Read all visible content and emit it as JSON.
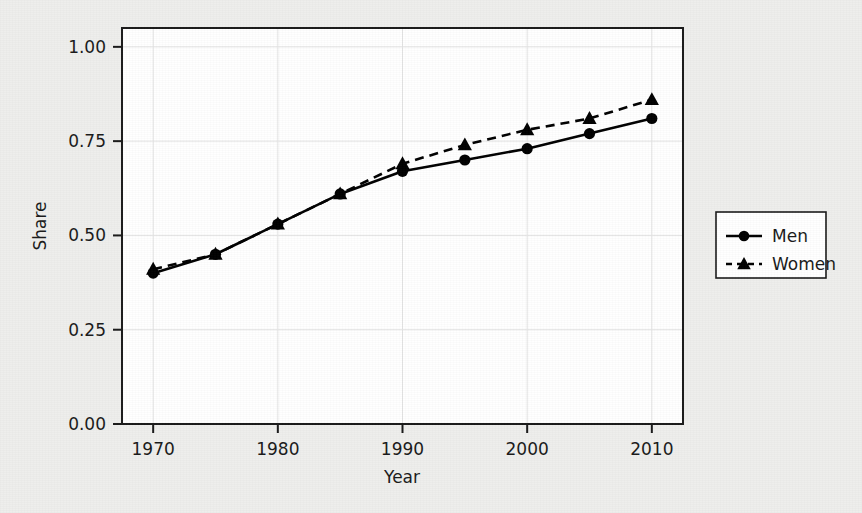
{
  "chart_data": {
    "type": "line",
    "title": "",
    "subtitle": "",
    "xlabel": "Year",
    "ylabel": "Share",
    "x": [
      1970,
      1975,
      1980,
      1985,
      1990,
      1995,
      2000,
      2005,
      2010
    ],
    "xlim": [
      1967.5,
      2012.5
    ],
    "ylim": [
      0.0,
      1.05
    ],
    "xticks": [
      1970,
      1980,
      1990,
      2000,
      2010
    ],
    "xtick_labels": [
      "1970",
      "1980",
      "1990",
      "2000",
      "2010"
    ],
    "yticks": [
      0.0,
      0.25,
      0.5,
      0.75,
      1.0
    ],
    "ytick_labels": [
      "0.00",
      "0.25",
      "0.50",
      "0.75",
      "1.00"
    ],
    "grid": true,
    "grid_axis": "both",
    "legend_position": "right-outside",
    "series": [
      {
        "name": "Men",
        "marker": "circle",
        "linestyle": "solid",
        "color": "#000000",
        "values": [
          0.4,
          0.45,
          0.53,
          0.61,
          0.67,
          0.7,
          0.73,
          0.77,
          0.81
        ]
      },
      {
        "name": "Women",
        "marker": "triangle",
        "linestyle": "dashed",
        "color": "#000000",
        "values": [
          0.41,
          0.45,
          0.53,
          0.61,
          0.69,
          0.74,
          0.78,
          0.81,
          0.86
        ]
      }
    ]
  },
  "legend": {
    "entries": [
      {
        "label": "Men",
        "marker": "circle",
        "linestyle": "solid"
      },
      {
        "label": "Women",
        "marker": "triangle",
        "linestyle": "dashed"
      }
    ]
  },
  "colors": {
    "background": "#eeeeec",
    "plot_background": "#ffffff",
    "axis": "#1a1a1a",
    "grid": "#e3e3e3",
    "ink": "#000000"
  }
}
